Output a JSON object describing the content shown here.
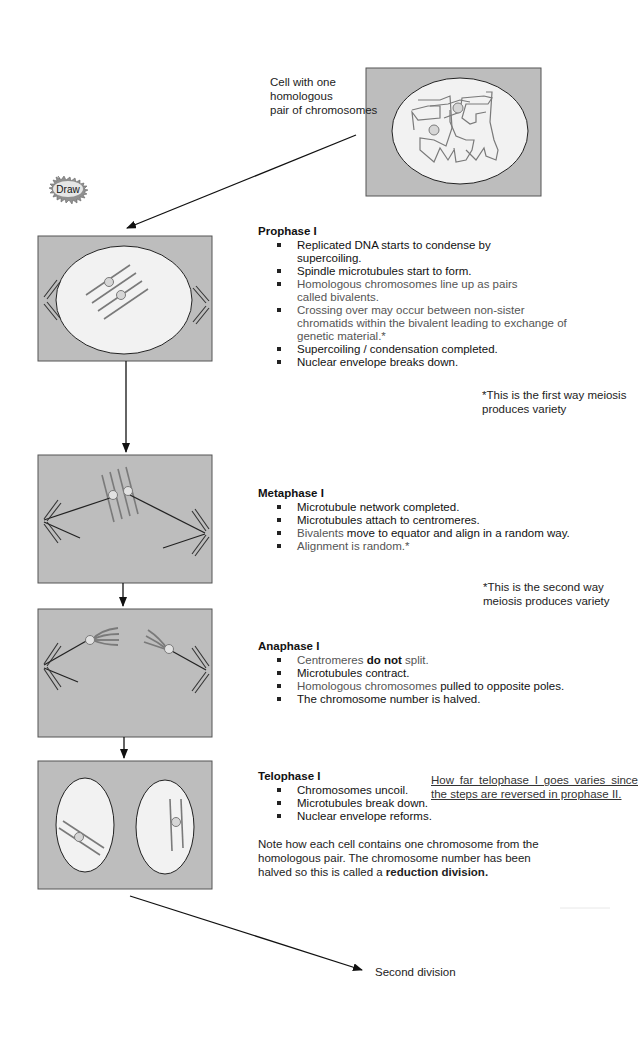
{
  "intro": {
    "label_line1": "Cell with one homologous",
    "label_line2": "pair of chromosomes"
  },
  "draw_badge": {
    "label": "Draw",
    "icon": "starburst-icon"
  },
  "stages": [
    {
      "title": "Prophase I",
      "bullets": [
        {
          "text": "Replicated DNA starts to condense by supercoiling.",
          "tone": "dark"
        },
        {
          "text": "Spindle microtubules start to form.",
          "tone": "dark"
        },
        {
          "text": "Homologous chromosomes line up as pairs called bivalents.",
          "tone": "grey"
        },
        {
          "text": "Crossing over may occur between non-sister chromatids within the bivalent leading to exchange of genetic material.*",
          "tone": "grey"
        },
        {
          "text": "Supercoiling / condensation completed.",
          "tone": "dark"
        },
        {
          "text": "Nuclear envelope breaks down.",
          "tone": "dark"
        }
      ],
      "footnote": "*This is the first way meiosis produces variety"
    },
    {
      "title": "Metaphase I",
      "bullets": [
        {
          "text": "Microtubule network completed.",
          "tone": "dark"
        },
        {
          "text": "Microtubules attach to centromeres.",
          "tone": "dark"
        },
        {
          "text_grey": "Bivalents",
          "text_dark": " move to equator and align in a random way.",
          "tone": "mixed"
        },
        {
          "text": "Alignment is random.*",
          "tone": "grey"
        }
      ],
      "footnote": "*This is the second way meiosis produces variety"
    },
    {
      "title": "Anaphase I",
      "bullets": [
        {
          "text_pre": "Centromeres ",
          "text_bold": "do not",
          "text_post": " split.",
          "tone": "grey"
        },
        {
          "text": "Microtubules contract.",
          "tone": "dark"
        },
        {
          "text_grey": "Homologous chromosomes",
          "text_dark": " pulled to opposite poles.",
          "tone": "mixed"
        },
        {
          "text": "The chromosome number is halved.",
          "tone": "dark"
        }
      ]
    },
    {
      "title": "Telophase I",
      "bullets": [
        {
          "text": "Chromosomes uncoil.",
          "tone": "dark"
        },
        {
          "text": "Microtubules break down.",
          "tone": "dark"
        },
        {
          "text": "Nuclear envelope reforms.",
          "tone": "dark"
        }
      ],
      "side_note": "How far telophase I goes varies since the steps are reversed in prophase II.",
      "summary_pre": "Note how each cell contains one chromosome from the homologous pair. The chromosome number has been halved so this is called a ",
      "summary_bold": "reduction division."
    }
  ],
  "outro": {
    "label": "Second division"
  },
  "colors": {
    "cell_box_fill": "#bdbdbd",
    "nucleus_fill": "#f2f2f2",
    "chromosome": "#7a7a7a",
    "centromere": "#d6d6d6",
    "spindle": "#222222",
    "arrow": "#111111"
  }
}
